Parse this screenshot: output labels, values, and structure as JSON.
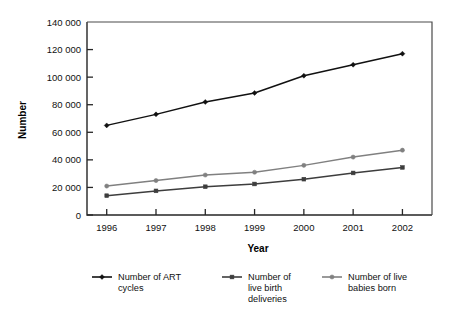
{
  "chart_data": {
    "type": "line",
    "title": "",
    "xlabel": "Year",
    "ylabel": "Number",
    "categories": [
      "1996",
      "1997",
      "1998",
      "1999",
      "2000",
      "2001",
      "2002"
    ],
    "x": [
      1996,
      1997,
      1998,
      1999,
      2000,
      2001,
      2002
    ],
    "xlim": [
      1995.6,
      2002.6
    ],
    "ylim": [
      0,
      140000
    ],
    "ytick_labels": [
      "0",
      "20 000",
      "40 000",
      "60 000",
      "80 000",
      "100 000",
      "120 000",
      "140 000"
    ],
    "ytick_values": [
      0,
      20000,
      40000,
      60000,
      80000,
      100000,
      120000,
      140000
    ],
    "grid": false,
    "legend_position": "bottom",
    "series": [
      {
        "name": "Number of ART cycles",
        "legend_line1": "Number of ART",
        "legend_line2": "cycles",
        "legend_line3": "",
        "color": "#111111",
        "marker": "diamond",
        "values": [
          65000,
          73000,
          82000,
          88500,
          101000,
          109000,
          117000
        ]
      },
      {
        "name": "Number of live birth deliveries",
        "legend_line1": "Number of",
        "legend_line2": "live birth",
        "legend_line3": "deliveries",
        "color": "#3d3d3d",
        "marker": "square",
        "values": [
          14000,
          17500,
          20500,
          22500,
          26000,
          30500,
          34500
        ]
      },
      {
        "name": "Number of live babies born",
        "legend_line1": "Number of live",
        "legend_line2": "babies born",
        "legend_line3": "",
        "color": "#808080",
        "marker": "circle",
        "values": [
          21000,
          25000,
          29000,
          31000,
          36000,
          42000,
          47000
        ]
      }
    ]
  },
  "colors": {
    "background": "#ffffff",
    "axis": "#262626",
    "frame": "#4a4a4a",
    "text": "#111111"
  }
}
